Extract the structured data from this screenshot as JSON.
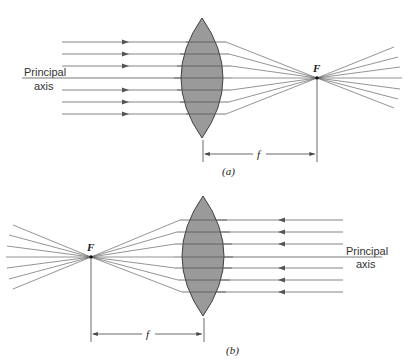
{
  "figure": {
    "panel_a": {
      "caption": "(a)",
      "axis_label_line1": "Principal",
      "axis_label_line2": "axis",
      "focal_point_label": "F",
      "focal_length_label": "f",
      "description": "Parallel rays entering from the left converge at focal point F to the right of a converging lens"
    },
    "panel_b": {
      "caption": "(b)",
      "axis_label_line1": "Principal",
      "axis_label_line2": "axis",
      "focal_point_label": "F",
      "focal_length_label": "f",
      "description": "Parallel rays entering from the right converge at focal point F to the left of a converging lens"
    },
    "colors": {
      "lens_fill": "#9a9a9a",
      "lens_stroke": "#444444",
      "ray": "#555555",
      "background": "#ffffff"
    }
  }
}
